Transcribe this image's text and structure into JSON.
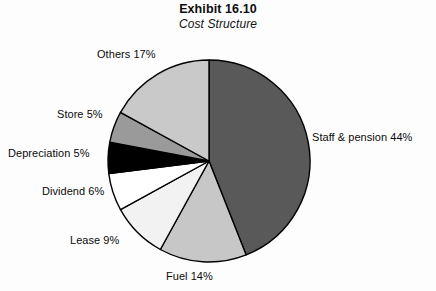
{
  "title": {
    "main": "Exhibit 16.10",
    "sub": "Cost Structure"
  },
  "chart_data": {
    "type": "pie",
    "title": "Exhibit 16.10",
    "subtitle": "Cost Structure",
    "xlabel": "",
    "ylabel": "",
    "grid": false,
    "legend": "none",
    "labels_position": "outside",
    "start_angle_deg": 0,
    "direction": "clockwise",
    "units": "percent",
    "total": 100,
    "categories": [
      "Staff & pension",
      "Fuel",
      "Lease",
      "Dividend",
      "Depreciation",
      "Store",
      "Others"
    ],
    "values": [
      44,
      14,
      9,
      6,
      5,
      5,
      17
    ],
    "data_labels": [
      "Staff & pension 44%",
      "Fuel 14%",
      "Lease 9%",
      "Dividend 6%",
      "Depreciation 5%",
      "Store 5%",
      "Others 17%"
    ],
    "slice_colors": [
      "#595959",
      "#c7c7c7",
      "#f2f2f2",
      "#ffffff",
      "#000000",
      "#9a9a9a",
      "#c9c9c9"
    ],
    "slice_outline_color": "#000000",
    "background_color": "#fdfdfd"
  },
  "slices": [
    {
      "name": "staff-pension",
      "label": "Staff & pension 44%",
      "value": 44,
      "color": "#595959"
    },
    {
      "name": "fuel",
      "label": "Fuel 14%",
      "value": 14,
      "color": "#c7c7c7"
    },
    {
      "name": "lease",
      "label": "Lease 9%",
      "value": 9,
      "color": "#f2f2f2"
    },
    {
      "name": "dividend",
      "label": "Dividend 6%",
      "value": 6,
      "color": "#ffffff"
    },
    {
      "name": "depreciation",
      "label": "Depreciation 5%",
      "value": 5,
      "color": "#000000"
    },
    {
      "name": "store",
      "label": "Store 5%",
      "value": 5,
      "color": "#9a9a9a"
    },
    {
      "name": "others",
      "label": "Others 17%",
      "value": 17,
      "color": "#c9c9c9"
    }
  ],
  "geometry": {
    "center_x": 209,
    "center_y": 161,
    "radius": 101
  }
}
